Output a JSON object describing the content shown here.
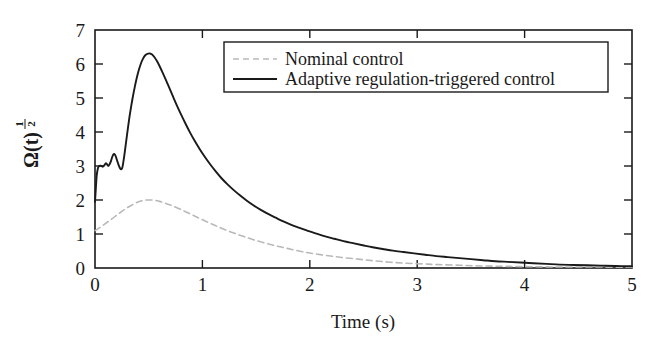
{
  "chart_data": {
    "type": "line",
    "title": "",
    "xlabel": "Time (s)",
    "ylabel": "Ω(t)^(1/2)",
    "ylabel_base": "Ω(t)",
    "ylabel_exp_num": "1",
    "ylabel_exp_den": "2",
    "xlim": [
      0,
      5
    ],
    "ylim": [
      0,
      7
    ],
    "xticks": [
      "0",
      "1",
      "2",
      "3",
      "4",
      "5"
    ],
    "yticks": [
      "0",
      "1",
      "2",
      "3",
      "4",
      "5",
      "6",
      "7"
    ],
    "grid": false,
    "legend_position": "upper-right",
    "series": [
      {
        "name": "Nominal control",
        "style": "dashed",
        "color": "#b9b9b9",
        "points": [
          [
            0.0,
            1.1
          ],
          [
            0.04,
            1.18
          ],
          [
            0.08,
            1.27
          ],
          [
            0.12,
            1.36
          ],
          [
            0.16,
            1.45
          ],
          [
            0.2,
            1.55
          ],
          [
            0.24,
            1.64
          ],
          [
            0.28,
            1.73
          ],
          [
            0.32,
            1.81
          ],
          [
            0.36,
            1.88
          ],
          [
            0.4,
            1.94
          ],
          [
            0.44,
            1.98
          ],
          [
            0.48,
            2.0
          ],
          [
            0.52,
            2.0
          ],
          [
            0.56,
            1.99
          ],
          [
            0.6,
            1.96
          ],
          [
            0.66,
            1.9
          ],
          [
            0.72,
            1.83
          ],
          [
            0.8,
            1.72
          ],
          [
            0.88,
            1.6
          ],
          [
            0.96,
            1.48
          ],
          [
            1.04,
            1.36
          ],
          [
            1.12,
            1.25
          ],
          [
            1.2,
            1.14
          ],
          [
            1.3,
            1.02
          ],
          [
            1.4,
            0.91
          ],
          [
            1.5,
            0.81
          ],
          [
            1.6,
            0.72
          ],
          [
            1.7,
            0.64
          ],
          [
            1.8,
            0.57
          ],
          [
            1.9,
            0.5
          ],
          [
            2.0,
            0.44
          ],
          [
            2.15,
            0.37
          ],
          [
            2.3,
            0.31
          ],
          [
            2.45,
            0.26
          ],
          [
            2.6,
            0.21
          ],
          [
            2.75,
            0.17
          ],
          [
            2.9,
            0.14
          ],
          [
            3.05,
            0.12
          ],
          [
            3.2,
            0.1
          ],
          [
            3.4,
            0.08
          ],
          [
            3.6,
            0.06
          ],
          [
            3.8,
            0.05
          ],
          [
            4.0,
            0.04
          ],
          [
            4.3,
            0.03
          ],
          [
            4.6,
            0.03
          ],
          [
            5.0,
            0.02
          ]
        ]
      },
      {
        "name": "Adaptive regulation-triggered control",
        "style": "solid",
        "color": "#1a1a1a",
        "points": [
          [
            0.0,
            1.95
          ],
          [
            0.008,
            2.35
          ],
          [
            0.016,
            2.72
          ],
          [
            0.026,
            2.92
          ],
          [
            0.036,
            2.99
          ],
          [
            0.048,
            3.01
          ],
          [
            0.06,
            3.0
          ],
          [
            0.072,
            2.98
          ],
          [
            0.086,
            3.02
          ],
          [
            0.1,
            3.08
          ],
          [
            0.112,
            3.05
          ],
          [
            0.124,
            3.0
          ],
          [
            0.136,
            3.05
          ],
          [
            0.15,
            3.16
          ],
          [
            0.162,
            3.28
          ],
          [
            0.174,
            3.35
          ],
          [
            0.186,
            3.33
          ],
          [
            0.198,
            3.24
          ],
          [
            0.21,
            3.12
          ],
          [
            0.222,
            3.01
          ],
          [
            0.234,
            2.93
          ],
          [
            0.244,
            2.9
          ],
          [
            0.254,
            2.95
          ],
          [
            0.264,
            3.12
          ],
          [
            0.276,
            3.38
          ],
          [
            0.29,
            3.72
          ],
          [
            0.305,
            4.08
          ],
          [
            0.32,
            4.42
          ],
          [
            0.336,
            4.74
          ],
          [
            0.352,
            5.03
          ],
          [
            0.37,
            5.32
          ],
          [
            0.388,
            5.58
          ],
          [
            0.406,
            5.8
          ],
          [
            0.426,
            6.0
          ],
          [
            0.446,
            6.15
          ],
          [
            0.466,
            6.25
          ],
          [
            0.488,
            6.3
          ],
          [
            0.51,
            6.31
          ],
          [
            0.532,
            6.28
          ],
          [
            0.554,
            6.2
          ],
          [
            0.578,
            6.08
          ],
          [
            0.604,
            5.92
          ],
          [
            0.632,
            5.73
          ],
          [
            0.662,
            5.52
          ],
          [
            0.694,
            5.28
          ],
          [
            0.728,
            5.03
          ],
          [
            0.764,
            4.77
          ],
          [
            0.802,
            4.51
          ],
          [
            0.842,
            4.25
          ],
          [
            0.884,
            3.99
          ],
          [
            0.928,
            3.74
          ],
          [
            0.974,
            3.5
          ],
          [
            1.022,
            3.27
          ],
          [
            1.072,
            3.05
          ],
          [
            1.124,
            2.84
          ],
          [
            1.178,
            2.64
          ],
          [
            1.234,
            2.46
          ],
          [
            1.292,
            2.29
          ],
          [
            1.352,
            2.13
          ],
          [
            1.414,
            1.98
          ],
          [
            1.478,
            1.84
          ],
          [
            1.544,
            1.71
          ],
          [
            1.612,
            1.59
          ],
          [
            1.682,
            1.48
          ],
          [
            1.754,
            1.37
          ],
          [
            1.828,
            1.27
          ],
          [
            1.904,
            1.18
          ],
          [
            1.982,
            1.09
          ],
          [
            2.062,
            1.01
          ],
          [
            2.144,
            0.93
          ],
          [
            2.228,
            0.86
          ],
          [
            2.314,
            0.79
          ],
          [
            2.402,
            0.73
          ],
          [
            2.492,
            0.67
          ],
          [
            2.584,
            0.61
          ],
          [
            2.678,
            0.56
          ],
          [
            2.774,
            0.51
          ],
          [
            2.872,
            0.47
          ],
          [
            2.972,
            0.43
          ],
          [
            3.074,
            0.39
          ],
          [
            3.178,
            0.35
          ],
          [
            3.284,
            0.32
          ],
          [
            3.392,
            0.29
          ],
          [
            3.502,
            0.26
          ],
          [
            3.614,
            0.23
          ],
          [
            3.728,
            0.2
          ],
          [
            3.844,
            0.18
          ],
          [
            3.962,
            0.16
          ],
          [
            4.082,
            0.14
          ],
          [
            4.204,
            0.12
          ],
          [
            4.328,
            0.1
          ],
          [
            4.454,
            0.09
          ],
          [
            4.582,
            0.08
          ],
          [
            4.712,
            0.07
          ],
          [
            4.844,
            0.06
          ],
          [
            5.0,
            0.05
          ]
        ]
      }
    ]
  },
  "legend": {
    "entries": [
      {
        "label": "Nominal control"
      },
      {
        "label": "Adaptive regulation-triggered control"
      }
    ]
  },
  "colors": {
    "axis": "#1a1a1a",
    "nominal": "#b9b9b9",
    "adaptive": "#1a1a1a",
    "background": "#ffffff"
  }
}
